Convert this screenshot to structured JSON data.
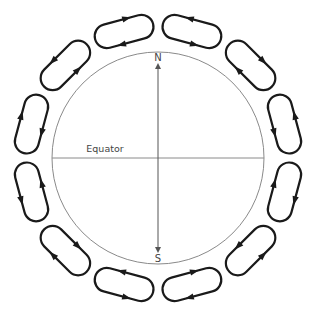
{
  "figure": {
    "labels": {
      "north": "N",
      "south": "S",
      "equator": "Equator"
    },
    "globe": {
      "center": [
        158,
        158
      ],
      "radius": 106,
      "stroke_color": "#8a8a8a"
    },
    "loops": {
      "ring_radius": 131,
      "length": 60,
      "width": 24,
      "stroke_color": "#1a1a1a",
      "items": [
        {
          "angle": 15,
          "outer_direction": "counterclockwise"
        },
        {
          "angle": 45,
          "outer_direction": "clockwise"
        },
        {
          "angle": 75,
          "outer_direction": "counterclockwise"
        },
        {
          "angle": 105,
          "outer_direction": "clockwise"
        },
        {
          "angle": 135,
          "outer_direction": "counterclockwise"
        },
        {
          "angle": 165,
          "outer_direction": "clockwise"
        },
        {
          "angle": 195,
          "outer_direction": "counterclockwise"
        },
        {
          "angle": 225,
          "outer_direction": "clockwise"
        },
        {
          "angle": 255,
          "outer_direction": "counterclockwise"
        },
        {
          "angle": 285,
          "outer_direction": "clockwise"
        },
        {
          "angle": 315,
          "outer_direction": "counterclockwise"
        },
        {
          "angle": 345,
          "outer_direction": "clockwise"
        }
      ]
    }
  }
}
